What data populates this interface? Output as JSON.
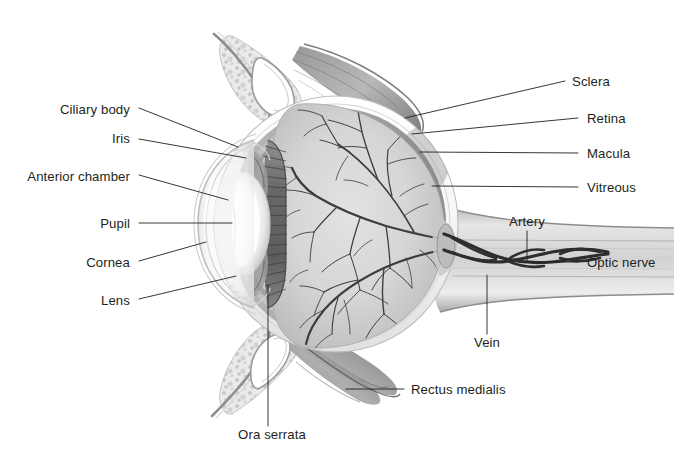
{
  "figure": {
    "width": 674,
    "height": 464,
    "background_color": "#ffffff",
    "text_color": "#231f20",
    "leader_line_color": "#231f20"
  },
  "palette": {
    "vitreous_gray": "#d5d5d5",
    "retina_gray": "#9a9a9a",
    "choroid_dark": "#6f6f6f",
    "sclera_white": "#fbfbfb",
    "sclera_shadow": "#e3e3e3",
    "vessel_dark": "#3a3a3a",
    "muscle_gray": "#8a8a8a",
    "muscle_dark": "#6a6a6a",
    "lens_white": "#ffffff",
    "ciliary_stripe": "#5e5e5e",
    "conjunctiva_stipple": "#cfcfcf"
  },
  "labels": {
    "left": [
      {
        "text": "Ciliary body",
        "x": 130,
        "y": 110,
        "leader": {
          "x1": 139,
          "y1": 108,
          "x2": 238,
          "y2": 147
        }
      },
      {
        "text": "Iris",
        "x": 130,
        "y": 139,
        "leader": {
          "x1": 139,
          "y1": 139,
          "x2": 246,
          "y2": 158
        }
      },
      {
        "text": "Anterior chamber",
        "x": 130,
        "y": 177,
        "leader": {
          "x1": 139,
          "y1": 175,
          "x2": 228,
          "y2": 200
        }
      },
      {
        "text": "Pupil",
        "x": 130,
        "y": 224,
        "leader": {
          "x1": 139,
          "y1": 223,
          "x2": 232,
          "y2": 223
        }
      },
      {
        "text": "Cornea",
        "x": 130,
        "y": 263,
        "leader": {
          "x1": 139,
          "y1": 261,
          "x2": 206,
          "y2": 242
        }
      },
      {
        "text": "Lens",
        "x": 130,
        "y": 301,
        "leader": {
          "x1": 139,
          "y1": 299,
          "x2": 236,
          "y2": 276
        }
      }
    ],
    "right": [
      {
        "text": "Sclera",
        "x": 572,
        "y": 82,
        "leader": {
          "x1": 565,
          "y1": 81,
          "x2": 405,
          "y2": 118
        }
      },
      {
        "text": "Retina",
        "x": 587,
        "y": 119,
        "leader": {
          "x1": 578,
          "y1": 118,
          "x2": 412,
          "y2": 134
        }
      },
      {
        "text": "Macula",
        "x": 587,
        "y": 154,
        "leader": {
          "x1": 578,
          "y1": 153,
          "x2": 420,
          "y2": 152
        }
      },
      {
        "text": "Vitreous",
        "x": 587,
        "y": 188,
        "leader": {
          "x1": 578,
          "y1": 187,
          "x2": 432,
          "y2": 186
        }
      },
      {
        "text": "Optic nerve",
        "x": 587,
        "y": 263,
        "leader": {
          "x1": 578,
          "y1": 262,
          "x2": 524,
          "y2": 262
        }
      }
    ],
    "interior": [
      {
        "text": "Artery",
        "x": 527,
        "y": 222,
        "align": "center",
        "leader": {
          "x1": 527,
          "y1": 231,
          "x2": 527,
          "y2": 262
        }
      },
      {
        "text": "Vein",
        "x": 487,
        "y": 343,
        "align": "center",
        "leader": {
          "x1": 487,
          "y1": 334,
          "x2": 487,
          "y2": 275
        }
      },
      {
        "text": "Rectus medialis",
        "x": 411,
        "y": 390,
        "align": "left",
        "leader": {
          "x1": 404,
          "y1": 389,
          "x2": 346,
          "y2": 389
        }
      },
      {
        "text": "Ora serrata",
        "x": 272,
        "y": 435,
        "align": "center",
        "leader": {
          "x1": 268,
          "y1": 426,
          "x2": 268,
          "y2": 285
        }
      }
    ]
  }
}
